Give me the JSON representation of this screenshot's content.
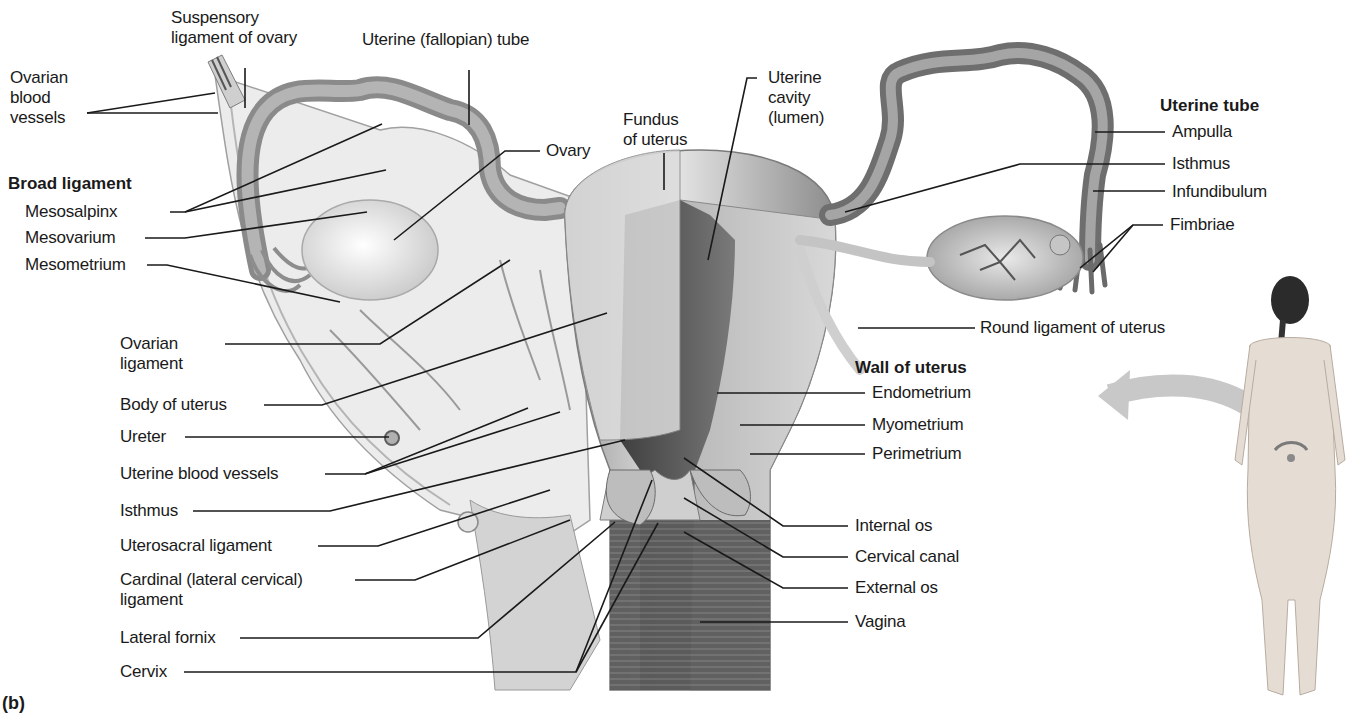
{
  "figure": {
    "panel_label": "(b)"
  },
  "headers": {
    "broad_ligament": "Broad ligament",
    "uterine_tube": "Uterine tube",
    "wall_of_uterus": "Wall of uterus"
  },
  "labels": {
    "ovarian_blood_vessels": [
      "Ovarian",
      "blood",
      "vessels"
    ],
    "suspensory_ligament": [
      "Suspensory",
      "ligament of ovary"
    ],
    "uterine_fallopian_tube": "Uterine (fallopian) tube",
    "fundus": [
      "Fundus",
      "of uterus"
    ],
    "uterine_cavity": [
      "Uterine",
      "cavity",
      "(lumen)"
    ],
    "ovary": "Ovary",
    "mesosalpinx": "Mesosalpinx",
    "mesovarium": "Mesovarium",
    "mesometrium": "Mesometrium",
    "ovarian_ligament": [
      "Ovarian",
      "ligament"
    ],
    "body_of_uterus": "Body of uterus",
    "ureter": "Ureter",
    "uterine_blood_vessels": "Uterine blood vessels",
    "isthmus_left": "Isthmus",
    "uterosacral_ligament": "Uterosacral ligament",
    "cardinal_ligament": [
      "Cardinal (lateral cervical)",
      "ligament"
    ],
    "lateral_fornix": "Lateral fornix",
    "cervix": "Cervix",
    "ampulla": "Ampulla",
    "isthmus_right": "Isthmus",
    "infundibulum": "Infundibulum",
    "fimbriae": "Fimbriae",
    "round_ligament": "Round ligament of uterus",
    "endometrium": "Endometrium",
    "myometrium": "Myometrium",
    "perimetrium": "Perimetrium",
    "internal_os": "Internal os",
    "cervical_canal": "Cervical canal",
    "external_os": "External os",
    "vagina": "Vagina"
  },
  "colors": {
    "tissue_light": "#d9d9d9",
    "tissue_mid": "#a8a8a8",
    "tissue_dark": "#5e5e5e",
    "leader_line": "#1a1a1a"
  }
}
